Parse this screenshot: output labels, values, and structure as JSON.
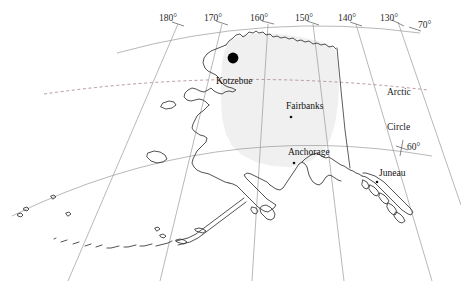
{
  "map": {
    "title": "Alaska reference map",
    "region": "Alaska",
    "projection": "conic",
    "background_color": "#ffffff",
    "land_fill_color": "#ffffff",
    "highlight_fill_color": "#f0f0f0",
    "coastline_color": "#333333",
    "graticule_color": "#9a9a9a",
    "arctic_circle_color": "#b08f8f",
    "marker_color": "#000000"
  },
  "graticule": {
    "meridian_labels": [
      {
        "id": "m180",
        "text": "180°",
        "x": 170,
        "y": 13
      },
      {
        "id": "m170",
        "text": "170°",
        "x": 215,
        "y": 13
      },
      {
        "id": "m160",
        "text": "160°",
        "x": 263,
        "y": 13
      },
      {
        "id": "m150",
        "text": "150°",
        "x": 308,
        "y": 13
      },
      {
        "id": "m140",
        "text": "140°",
        "x": 351,
        "y": 13
      },
      {
        "id": "m130",
        "text": "130°",
        "x": 393,
        "y": 13
      }
    ],
    "parallel_labels": [
      {
        "id": "p70",
        "text": "70°",
        "x": 419,
        "y": 21
      },
      {
        "id": "p60",
        "text": "60°",
        "x": 408,
        "y": 145
      }
    ]
  },
  "annotations": [
    {
      "id": "arctic-circle",
      "line1": "Arctic",
      "line2": "Circle",
      "x": 388,
      "y": 66
    }
  ],
  "cities": [
    {
      "id": "kotzebue",
      "name": "Kotzebue",
      "label_x": 216,
      "label_y": 78,
      "dot_x": 233,
      "dot_y": 58,
      "dot_r": 5.4,
      "dot_style": "large"
    },
    {
      "id": "fairbanks",
      "name": "Fairbanks",
      "label_x": 286,
      "label_y": 103,
      "dot_x": 291,
      "dot_y": 117,
      "dot_r": 1.3,
      "dot_style": "small"
    },
    {
      "id": "anchorage",
      "name": "Anchorage",
      "label_x": 288,
      "label_y": 149,
      "dot_x": 294,
      "dot_y": 163,
      "dot_r": 1.3,
      "dot_style": "small"
    },
    {
      "id": "juneau",
      "name": "Juneau",
      "label_x": 379,
      "label_y": 170,
      "dot_x": 377,
      "dot_y": 182,
      "dot_r": 1.3,
      "dot_style": "small"
    }
  ]
}
